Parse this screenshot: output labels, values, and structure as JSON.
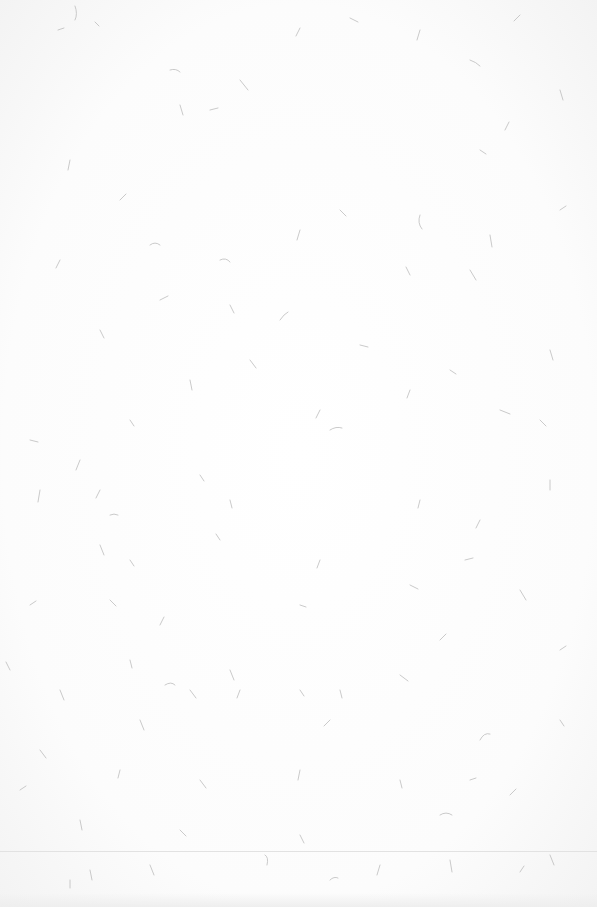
{
  "scene": {
    "description": "Blank textured white paper with scattered grey fibers",
    "background_color": "#fdfdfd",
    "fiber_color": "#b8b8b8",
    "fold_line": {
      "y": 851,
      "color": "#e2e2e2"
    }
  }
}
